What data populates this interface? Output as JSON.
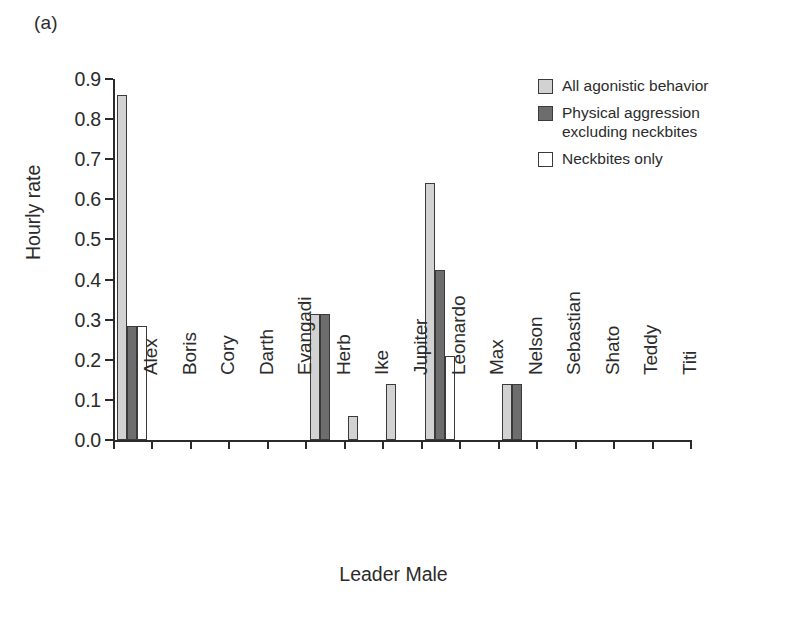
{
  "panel": {
    "label": "(a)"
  },
  "chart_data": {
    "type": "bar",
    "title": "",
    "subtitle": "",
    "xlabel": "Leader Male",
    "ylabel": "Hourly rate",
    "ylim": [
      0.0,
      0.9
    ],
    "ytick_labels": [
      "0.0",
      "0.1",
      "0.2",
      "0.3",
      "0.4",
      "0.5",
      "0.6",
      "0.7",
      "0.8",
      "0.9"
    ],
    "ytick_values": [
      0.0,
      0.1,
      0.2,
      0.3,
      0.4,
      0.5,
      0.6,
      0.7,
      0.8,
      0.9
    ],
    "grid": false,
    "legend_position": "top-right",
    "categories": [
      "Alex",
      "Boris",
      "Cory",
      "Darth",
      "Evangadi",
      "Herb",
      "Ike",
      "Jupiter",
      "Leonardo",
      "Max",
      "Nelson",
      "Sebastian",
      "Shato",
      "Teddy",
      "Titi"
    ],
    "series": [
      {
        "name": "All agonistic behavior",
        "color": "#d2d2d2",
        "values": [
          0.86,
          0,
          0,
          0,
          0,
          0.315,
          0.06,
          0.14,
          0.64,
          0,
          0.14,
          0,
          0,
          0,
          0
        ]
      },
      {
        "name": "Physical aggression excluding neckbites",
        "color": "#6d6d6d",
        "values": [
          0.285,
          0,
          0,
          0,
          0,
          0.315,
          0,
          0,
          0.425,
          0,
          0.14,
          0,
          0,
          0,
          0
        ]
      },
      {
        "name": "Neckbites only",
        "color": "#ffffff",
        "values": [
          0.285,
          0,
          0,
          0,
          0,
          0,
          0,
          0,
          0.21,
          0,
          0,
          0,
          0,
          0,
          0
        ]
      }
    ]
  },
  "legend": {
    "items": [
      {
        "label": "All agonistic behavior",
        "swatch": "s0"
      },
      {
        "label": "Physical aggression\nexcluding neckbites",
        "swatch": "s1"
      },
      {
        "label": "Neckbites only",
        "swatch": "s2"
      }
    ]
  }
}
